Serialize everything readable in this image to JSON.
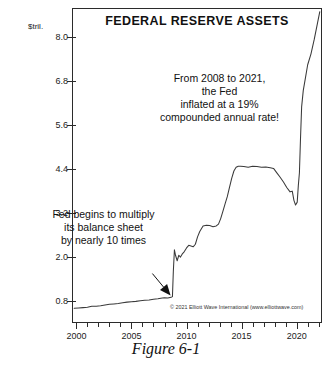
{
  "figure": {
    "caption": "Figure 6-1",
    "copyright": "© 2021 Elliott Wave International (www.elliottwave.com)"
  },
  "annotations": {
    "right": [
      "From 2008 to 2021,",
      "the Fed",
      "inflated at a 19%",
      "compounded annual rate!"
    ],
    "left": [
      "Fed begins to multiply",
      "its balance sheet",
      "by nearly 10 times"
    ]
  },
  "chart_data": {
    "type": "line",
    "title": "FEDERAL RESERVE ASSETS",
    "xlabel": "",
    "ylabel": "$tril.",
    "yunit_label": "$tril.",
    "xlim": [
      1999.6,
      2022.3
    ],
    "ylim": [
      0.2,
      8.8
    ],
    "grid": false,
    "legend": "none",
    "ytick_labels": [
      "8.0",
      "6.8",
      "5.6",
      "4.4",
      "3.2",
      "2.0",
      "0.8"
    ],
    "ytick_values": [
      8.0,
      6.8,
      5.6,
      4.4,
      3.2,
      2.0,
      0.8
    ],
    "xtick_labels": [
      "2000",
      "2005",
      "2010",
      "2015",
      "2020"
    ],
    "xtick_values": [
      2000,
      2005,
      2010,
      2015,
      2020
    ],
    "xtick_minor_values": [
      2001,
      2002,
      2003,
      2004,
      2006,
      2007,
      2008,
      2009,
      2011,
      2012,
      2013,
      2014,
      2016,
      2017,
      2018,
      2019,
      2021,
      2022
    ],
    "series": [
      {
        "name": "Federal Reserve Assets",
        "color": "#3a3a3a",
        "x": [
          1999.8,
          2000.2,
          2000.6,
          2001.0,
          2001.4,
          2001.8,
          2002.2,
          2002.6,
          2003.0,
          2003.4,
          2003.8,
          2004.2,
          2004.6,
          2005.0,
          2005.4,
          2005.8,
          2006.2,
          2006.6,
          2007.0,
          2007.4,
          2007.8,
          2008.0,
          2008.3,
          2008.6,
          2008.72,
          2008.8,
          2008.9,
          2009.0,
          2009.15,
          2009.3,
          2009.45,
          2009.6,
          2009.8,
          2010.0,
          2010.2,
          2010.4,
          2010.6,
          2010.8,
          2011.0,
          2011.2,
          2011.5,
          2011.8,
          2012.1,
          2012.4,
          2012.7,
          2012.9,
          2013.1,
          2013.3,
          2013.5,
          2013.7,
          2013.9,
          2014.1,
          2014.3,
          2014.5,
          2014.7,
          2014.9,
          2015.2,
          2015.6,
          2016.0,
          2016.4,
          2016.8,
          2017.2,
          2017.6,
          2017.9,
          2018.2,
          2018.5,
          2018.8,
          2019.1,
          2019.4,
          2019.6,
          2019.75,
          2019.9,
          2020.05,
          2020.15,
          2020.25,
          2020.35,
          2020.45,
          2020.6,
          2020.8,
          2021.0,
          2021.3,
          2021.6,
          2021.9,
          2022.1
        ],
        "y": [
          0.6,
          0.61,
          0.62,
          0.63,
          0.66,
          0.66,
          0.67,
          0.69,
          0.71,
          0.72,
          0.73,
          0.75,
          0.77,
          0.78,
          0.79,
          0.81,
          0.82,
          0.83,
          0.85,
          0.86,
          0.88,
          0.89,
          0.88,
          0.9,
          0.92,
          1.6,
          2.2,
          2.05,
          1.9,
          2.05,
          2.0,
          2.08,
          2.15,
          2.25,
          2.32,
          2.3,
          2.28,
          2.35,
          2.55,
          2.7,
          2.85,
          2.87,
          2.86,
          2.83,
          2.85,
          2.9,
          3.05,
          3.25,
          3.45,
          3.65,
          3.9,
          4.15,
          4.35,
          4.45,
          4.48,
          4.48,
          4.47,
          4.45,
          4.48,
          4.47,
          4.45,
          4.46,
          4.44,
          4.42,
          4.3,
          4.18,
          4.05,
          3.9,
          3.78,
          3.8,
          3.55,
          3.42,
          3.5,
          3.95,
          4.3,
          5.25,
          6.1,
          6.55,
          6.9,
          7.25,
          7.55,
          7.95,
          8.4,
          8.7
        ]
      }
    ],
    "annotation_arrow": {
      "from_x": 2006.9,
      "from_y": 1.55,
      "to_x": 2008.55,
      "to_y": 0.95
    }
  }
}
